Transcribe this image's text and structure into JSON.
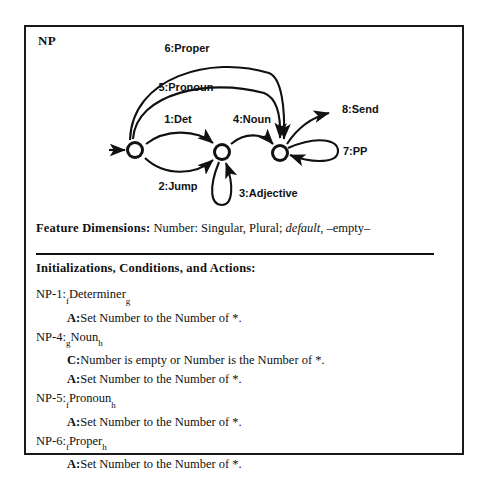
{
  "frame": {
    "title": "NP"
  },
  "automaton": {
    "states": [
      {
        "id": "f",
        "label": "f",
        "cx": 109,
        "cy": 123
      },
      {
        "id": "g",
        "label": "g",
        "cx": 196,
        "cy": 125
      },
      {
        "id": "h",
        "label": "h",
        "cx": 254,
        "cy": 126
      }
    ],
    "start_arrow": {
      "from_x": 83,
      "to_x": 99,
      "y": 123
    },
    "edges": [
      {
        "id": "1",
        "label": "1:Det",
        "from": "f",
        "to": "g",
        "kind": "arc-above"
      },
      {
        "id": "2",
        "label": "2:Jump",
        "from": "f",
        "to": "g",
        "kind": "arc-below"
      },
      {
        "id": "3",
        "label": "3:Adjective",
        "from": "g",
        "to": "g",
        "kind": "self-loop-below"
      },
      {
        "id": "4",
        "label": "4:Noun",
        "from": "g",
        "to": "h",
        "kind": "arc-above"
      },
      {
        "id": "5",
        "label": "5:Pronoun",
        "from": "f",
        "to": "h",
        "kind": "big-arc-inner"
      },
      {
        "id": "6",
        "label": "6:Proper",
        "from": "f",
        "to": "h",
        "kind": "big-arc-outer"
      },
      {
        "id": "7",
        "label": "7:PP",
        "from": "h",
        "to": "h",
        "kind": "self-loop-right"
      },
      {
        "id": "8",
        "label": "8:Send",
        "from": "h",
        "to": "exit",
        "kind": "exit-arc"
      }
    ]
  },
  "feature_dimensions": {
    "label": "Feature Dimensions:",
    "text_plain": " Number: Singular, Plural; ",
    "italic_word": "default",
    "tail": ", –empty–"
  },
  "rules_section": {
    "heading": "Initializations, Conditions, and Actions:",
    "rules": [
      {
        "id": "NP-1:",
        "sub_from": "f",
        "arc_name": "Determiner",
        "sub_to": "g",
        "lines": [
          {
            "tag": "A:",
            "text": "Set Number to the Number of *."
          }
        ]
      },
      {
        "id": "NP-4:",
        "sub_from": "g",
        "arc_name": "Noun",
        "sub_to": "h",
        "lines": [
          {
            "tag": "C:",
            "text": "Number is empty or Number is the Number of *."
          },
          {
            "tag": "A:",
            "text": "Set Number to the Number of *."
          }
        ]
      },
      {
        "id": "NP-5:",
        "sub_from": "f",
        "arc_name": "Pronoun",
        "sub_to": "h",
        "lines": [
          {
            "tag": "A:",
            "text": "Set Number to the Number of *."
          }
        ]
      },
      {
        "id": "NP-6:",
        "sub_from": "f",
        "arc_name": "Proper",
        "sub_to": "h",
        "lines": [
          {
            "tag": "A:",
            "text": "Set Number to the Number of *."
          }
        ]
      }
    ]
  },
  "colors": {
    "ink": "#111111",
    "paper": "#ffffff"
  }
}
